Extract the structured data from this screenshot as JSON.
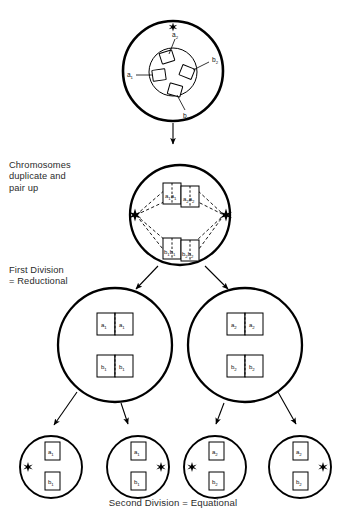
{
  "figure": {
    "background_color": "#ffffff",
    "line_color": "#000000"
  },
  "captions": {
    "duplicate": "Chromosomes\nduplicate and\npair up",
    "first_division": "First Division\n= Reductional",
    "second_division": "Second Division  =  Equational"
  },
  "stages": [
    {
      "id": "parent-cell",
      "name": "parent-cell",
      "description": "Diploid parent cell with nucleus containing four chromosomes",
      "aster_count": 1,
      "aster_positions": [
        "top"
      ],
      "chromosomes": [
        {
          "label": "a",
          "subscript": "2",
          "position": "nucleus-top"
        },
        {
          "label": "b",
          "subscript": "2",
          "position": "nucleus-right"
        },
        {
          "label": "a",
          "subscript": "1",
          "position": "nucleus-left"
        },
        {
          "label": "b",
          "subscript": "1",
          "position": "nucleus-bottom"
        }
      ]
    },
    {
      "id": "paired-cell",
      "name": "duplicated-paired-cell",
      "description": "Chromosomes duplicated and paired on the metaphase plate with spindle between two asters",
      "aster_count": 2,
      "aster_positions": [
        "left",
        "right"
      ],
      "chromosome_groups": [
        {
          "group": "a-bivalent",
          "chromatids": [
            {
              "label": "a",
              "subscript": "1"
            },
            {
              "label": "a",
              "subscript": "1"
            },
            {
              "label": "a",
              "subscript": "2"
            },
            {
              "label": "a",
              "subscript": "2"
            }
          ]
        },
        {
          "group": "b-bivalent",
          "chromatids": [
            {
              "label": "b",
              "subscript": "1"
            },
            {
              "label": "b",
              "subscript": "1"
            },
            {
              "label": "b",
              "subscript": "2"
            },
            {
              "label": "b",
              "subscript": "2"
            }
          ]
        }
      ]
    },
    {
      "id": "daughter-cell-left",
      "name": "first-division-daughter-left",
      "description": "Left daughter cell after the reductional division",
      "aster_count": 0,
      "chromosome_groups": [
        {
          "group": "a",
          "chromatids": [
            {
              "label": "a",
              "subscript": "1"
            },
            {
              "label": "a",
              "subscript": "1"
            }
          ]
        },
        {
          "group": "b",
          "chromatids": [
            {
              "label": "b",
              "subscript": "1"
            },
            {
              "label": "b",
              "subscript": "1"
            }
          ]
        }
      ]
    },
    {
      "id": "daughter-cell-right",
      "name": "first-division-daughter-right",
      "description": "Right daughter cell after the reductional division",
      "aster_count": 0,
      "chromosome_groups": [
        {
          "group": "a",
          "chromatids": [
            {
              "label": "a",
              "subscript": "2"
            },
            {
              "label": "a",
              "subscript": "2"
            }
          ]
        },
        {
          "group": "b",
          "chromatids": [
            {
              "label": "b",
              "subscript": "2"
            },
            {
              "label": "b",
              "subscript": "2"
            }
          ]
        }
      ]
    }
  ],
  "gametes": [
    {
      "id": "gamete-1",
      "name": "gamete-one",
      "aster_side": "left",
      "chromosomes": [
        {
          "label": "a",
          "subscript": "1"
        },
        {
          "label": "b",
          "subscript": "1"
        }
      ]
    },
    {
      "id": "gamete-2",
      "name": "gamete-two",
      "aster_side": "right",
      "chromosomes": [
        {
          "label": "a",
          "subscript": "1"
        },
        {
          "label": "b",
          "subscript": "1"
        }
      ]
    },
    {
      "id": "gamete-3",
      "name": "gamete-three",
      "aster_side": "left",
      "chromosomes": [
        {
          "label": "a",
          "subscript": "2"
        },
        {
          "label": "b",
          "subscript": "2"
        }
      ]
    },
    {
      "id": "gamete-4",
      "name": "gamete-four",
      "aster_side": "right",
      "chromosomes": [
        {
          "label": "a",
          "subscript": "2"
        },
        {
          "label": "b",
          "subscript": "2"
        }
      ]
    }
  ],
  "labels": {
    "parent": {
      "a1": {
        "letter": "a",
        "sub": "1"
      },
      "a2": {
        "letter": "a",
        "sub": "2"
      },
      "b1": {
        "letter": "b",
        "sub": "1"
      },
      "b2": {
        "letter": "b",
        "sub": "2"
      }
    },
    "letters": {
      "a": "a",
      "b": "b"
    },
    "subs": {
      "one": "1",
      "two": "2"
    }
  }
}
